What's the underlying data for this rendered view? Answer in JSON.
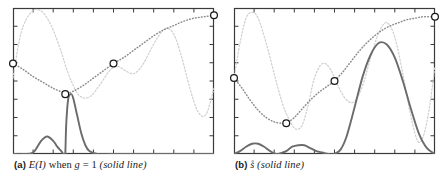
{
  "figure": {
    "background_color": "#ffffff",
    "panel_count": 2
  },
  "panels": [
    {
      "id": "a",
      "caption_label": "(a)",
      "caption_math": "E(I)",
      "caption_text_1": "when",
      "caption_math_2": "g",
      "caption_eq": "= 1",
      "caption_paren": "(solid line)",
      "caption_full": "(a) E(I) when g = 1 (solid line)"
    },
    {
      "id": "b",
      "caption_label": "(b)",
      "caption_math": "s̊",
      "caption_paren": "(solid line)",
      "caption_full": "(b) s̊ (solid line)"
    }
  ],
  "colors": {
    "axis": "#3a3a3a",
    "solid_curve": "#6b6b6b",
    "light_curve": "#cfcfcf",
    "dotted_curve": "#8c8c8c",
    "marker_stroke": "#1a1a1a",
    "marker_fill": "#ffffff",
    "caption_text": "#1a1a1a"
  },
  "chart_data": [
    {
      "type": "line",
      "panel": "a",
      "title": "(a) E(I) when g = 1 (solid line)",
      "xlabel": "",
      "ylabel": "",
      "xlim": [
        0,
        1
      ],
      "ylim": [
        0,
        1
      ],
      "grid": false,
      "legend": "none",
      "x_ticks": [
        0,
        0.1,
        0.2,
        0.3,
        0.4,
        0.5,
        0.6,
        0.7,
        0.8,
        0.9,
        1.0
      ],
      "y_ticks": [
        0,
        0.125,
        0.25,
        0.375,
        0.5,
        0.625,
        0.75,
        0.875,
        1.0
      ],
      "series": [
        {
          "name": "light-dashed-objective",
          "style": "dashed",
          "color": "#cfcfcf",
          "x": [
            0.0,
            0.04,
            0.09,
            0.14,
            0.19,
            0.24,
            0.26,
            0.29,
            0.33,
            0.38,
            0.43,
            0.48,
            0.52,
            0.56,
            0.6,
            0.64,
            0.68,
            0.72,
            0.76,
            0.8,
            0.84,
            0.88,
            0.92,
            0.96,
            1.0
          ],
          "y": [
            0.52,
            0.83,
            0.97,
            0.98,
            0.88,
            0.7,
            0.61,
            0.5,
            0.4,
            0.39,
            0.47,
            0.57,
            0.6,
            0.57,
            0.55,
            0.6,
            0.7,
            0.8,
            0.86,
            0.82,
            0.66,
            0.45,
            0.29,
            0.27,
            0.45
          ]
        },
        {
          "name": "dotted-posterior-mean",
          "style": "dotted",
          "color": "#8c8c8c",
          "x": [
            0.0,
            0.05,
            0.1,
            0.15,
            0.2,
            0.25,
            0.26,
            0.3,
            0.35,
            0.4,
            0.45,
            0.5,
            0.55,
            0.6,
            0.65,
            0.7,
            0.75,
            0.8,
            0.85,
            0.9,
            0.95,
            1.0
          ],
          "y": [
            0.62,
            0.58,
            0.53,
            0.49,
            0.45,
            0.42,
            0.41,
            0.43,
            0.47,
            0.52,
            0.57,
            0.62,
            0.66,
            0.71,
            0.76,
            0.81,
            0.85,
            0.88,
            0.91,
            0.93,
            0.94,
            0.95
          ]
        },
        {
          "name": "solid-acquisition",
          "style": "solid",
          "color": "#6b6b6b",
          "x": [
            0.0,
            0.05,
            0.1,
            0.14,
            0.17,
            0.2,
            0.22,
            0.24,
            0.25,
            0.255,
            0.26,
            0.265,
            0.275,
            0.29,
            0.3,
            0.32,
            0.34,
            0.36,
            0.38,
            0.42,
            0.48,
            0.55,
            0.7,
            0.85,
            1.0
          ],
          "y": [
            0.0,
            0.0,
            0.01,
            0.09,
            0.12,
            0.09,
            0.05,
            0.02,
            0.0,
            0.0,
            0.0,
            0.21,
            0.38,
            0.41,
            0.38,
            0.26,
            0.14,
            0.06,
            0.02,
            0.0,
            0.0,
            0.0,
            0.0,
            0.0,
            0.0
          ]
        }
      ],
      "markers": [
        {
          "name": "observation-1",
          "x": 0.0,
          "y": 0.62
        },
        {
          "name": "observation-2",
          "x": 0.26,
          "y": 0.41
        },
        {
          "name": "observation-3",
          "x": 0.5,
          "y": 0.62
        },
        {
          "name": "observation-4",
          "x": 1.0,
          "y": 0.95
        }
      ]
    },
    {
      "type": "line",
      "panel": "b",
      "title": "(b) s̊ (solid line)",
      "xlabel": "",
      "ylabel": "",
      "xlim": [
        0,
        1
      ],
      "ylim": [
        0,
        1
      ],
      "grid": false,
      "legend": "none",
      "x_ticks": [
        0,
        0.1,
        0.2,
        0.3,
        0.4,
        0.5,
        0.6,
        0.7,
        0.8,
        0.9,
        1.0
      ],
      "y_ticks": [
        0,
        0.125,
        0.25,
        0.375,
        0.5,
        0.625,
        0.75,
        0.875,
        1.0
      ],
      "series": [
        {
          "name": "light-dashed-objective",
          "style": "dashed",
          "color": "#cfcfcf",
          "x": [
            0.0,
            0.03,
            0.06,
            0.09,
            0.12,
            0.16,
            0.2,
            0.24,
            0.28,
            0.31,
            0.34,
            0.37,
            0.4,
            0.44,
            0.48,
            0.52,
            0.56,
            0.6,
            0.64,
            0.68,
            0.72,
            0.76,
            0.8,
            0.84,
            0.88,
            0.92,
            0.96,
            1.0
          ],
          "y": [
            0.52,
            0.76,
            0.93,
            0.97,
            0.93,
            0.76,
            0.55,
            0.35,
            0.22,
            0.17,
            0.2,
            0.34,
            0.52,
            0.62,
            0.58,
            0.46,
            0.37,
            0.36,
            0.47,
            0.66,
            0.83,
            0.9,
            0.8,
            0.55,
            0.26,
            0.08,
            0.22,
            0.6
          ]
        },
        {
          "name": "dotted-posterior-mean",
          "style": "dotted",
          "color": "#8c8c8c",
          "x": [
            0.0,
            0.04,
            0.08,
            0.12,
            0.16,
            0.2,
            0.24,
            0.26,
            0.3,
            0.34,
            0.38,
            0.42,
            0.46,
            0.5,
            0.54,
            0.58,
            0.62,
            0.66,
            0.7,
            0.74,
            0.78,
            0.82,
            0.86,
            0.9,
            0.94,
            1.0
          ],
          "y": [
            0.52,
            0.45,
            0.37,
            0.3,
            0.25,
            0.22,
            0.21,
            0.21,
            0.25,
            0.31,
            0.37,
            0.42,
            0.46,
            0.5,
            0.56,
            0.63,
            0.7,
            0.76,
            0.81,
            0.85,
            0.88,
            0.9,
            0.92,
            0.93,
            0.94,
            0.94
          ]
        },
        {
          "name": "solid-acquisition",
          "style": "solid",
          "color": "#6b6b6b",
          "x": [
            0.0,
            0.03,
            0.06,
            0.09,
            0.12,
            0.15,
            0.18,
            0.21,
            0.24,
            0.26,
            0.29,
            0.32,
            0.35,
            0.38,
            0.41,
            0.44,
            0.47,
            0.5,
            0.53,
            0.56,
            0.6,
            0.64,
            0.68,
            0.72,
            0.76,
            0.8,
            0.84,
            0.88,
            0.92,
            0.96,
            1.0
          ],
          "y": [
            0.0,
            0.02,
            0.05,
            0.07,
            0.07,
            0.05,
            0.02,
            0.0,
            0.01,
            0.02,
            0.05,
            0.06,
            0.06,
            0.04,
            0.02,
            0.01,
            0.0,
            0.0,
            0.03,
            0.12,
            0.32,
            0.53,
            0.68,
            0.76,
            0.75,
            0.66,
            0.5,
            0.31,
            0.14,
            0.04,
            0.0
          ]
        }
      ],
      "markers": [
        {
          "name": "observation-1",
          "x": 0.0,
          "y": 0.52
        },
        {
          "name": "observation-2",
          "x": 0.26,
          "y": 0.21
        },
        {
          "name": "observation-3",
          "x": 0.5,
          "y": 0.5
        },
        {
          "name": "observation-4",
          "x": 1.0,
          "y": 0.94
        }
      ]
    }
  ]
}
